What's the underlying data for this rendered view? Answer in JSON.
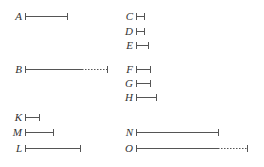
{
  "diagram": {
    "type": "line-segment-proportions",
    "line_color": "#555555",
    "segments": [
      {
        "label": "A",
        "x1": 25,
        "x2": 67,
        "y": 16,
        "dotted_from": null
      },
      {
        "label": "B",
        "x1": 25,
        "x2": 107,
        "y": 69,
        "dotted_from": 82
      },
      {
        "label": "C",
        "x1": 136,
        "x2": 144,
        "y": 16,
        "dotted_from": null
      },
      {
        "label": "D",
        "x1": 136,
        "x2": 144,
        "y": 31,
        "dotted_from": null
      },
      {
        "label": "E",
        "x1": 136,
        "x2": 148,
        "y": 45,
        "dotted_from": null
      },
      {
        "label": "F",
        "x1": 136,
        "x2": 150,
        "y": 69,
        "dotted_from": null
      },
      {
        "label": "G",
        "x1": 136,
        "x2": 150,
        "y": 83,
        "dotted_from": null
      },
      {
        "label": "H",
        "x1": 136,
        "x2": 156,
        "y": 97,
        "dotted_from": null
      },
      {
        "label": "K",
        "x1": 25,
        "x2": 39,
        "y": 117,
        "dotted_from": null
      },
      {
        "label": "M",
        "x1": 25,
        "x2": 53,
        "y": 132,
        "dotted_from": null
      },
      {
        "label": "L",
        "x1": 25,
        "x2": 80,
        "y": 148,
        "dotted_from": null
      },
      {
        "label": "N",
        "x1": 136,
        "x2": 218,
        "y": 132,
        "dotted_from": null
      },
      {
        "label": "O",
        "x1": 136,
        "x2": 247,
        "y": 148,
        "dotted_from": 218
      }
    ]
  }
}
